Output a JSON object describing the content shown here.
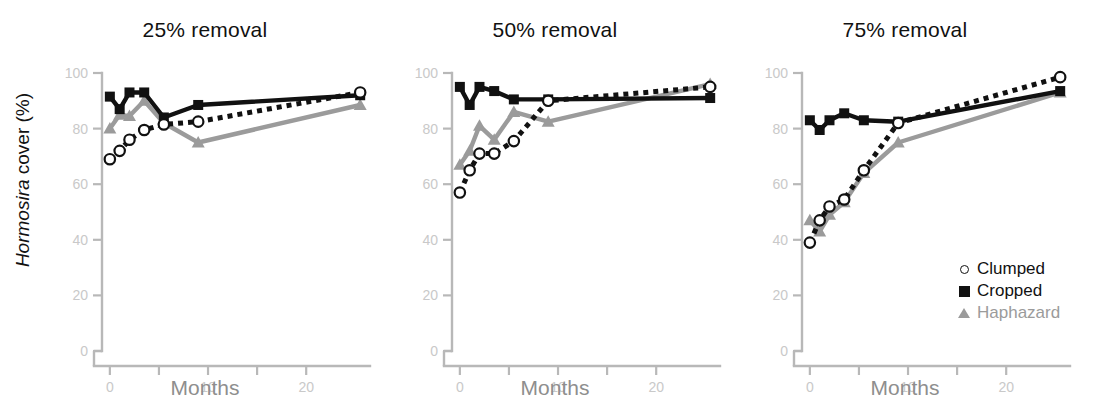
{
  "figure": {
    "ylabel_italic": "Hormosira",
    "ylabel_rest": " cover (%)",
    "ylabel_full": "Hormosira cover (%)"
  },
  "legend": {
    "position": "inside-bottom-right-panel3",
    "items": [
      {
        "label": "Clumped",
        "marker": "open-circle",
        "color": "#111111"
      },
      {
        "label": "Cropped",
        "marker": "filled-square",
        "color": "#111111"
      },
      {
        "label": "Haphazard",
        "marker": "filled-triangle",
        "color": "#9b9b9b"
      }
    ]
  },
  "colors": {
    "clumped": "#111111",
    "cropped": "#111111",
    "haphazard": "#9b9b9b",
    "axis": "#b8b8b8",
    "tick_text": "#c9c9c9",
    "xlabel": "#8e8e8e",
    "title": "#111111"
  },
  "chart_data": [
    {
      "type": "line",
      "title": "25% removal",
      "xlabel": "Months",
      "ylabel": "Hormosira cover (%)",
      "xlim": [
        -0.8,
        26.5
      ],
      "ylim": [
        0,
        100
      ],
      "xticks": [
        0,
        10,
        20
      ],
      "xminorticks": [
        5,
        15
      ],
      "yticks": [
        0,
        20,
        40,
        60,
        80,
        100
      ],
      "grid": false,
      "series": [
        {
          "name": "Clumped",
          "marker": "open-circle",
          "linestyle": "dotted",
          "color": "#111111",
          "x": [
            0,
            1,
            2,
            3.5,
            5.5,
            9,
            25.5
          ],
          "y": [
            69,
            72,
            76,
            79.5,
            81.5,
            82.5,
            93
          ]
        },
        {
          "name": "Cropped",
          "marker": "filled-square",
          "linestyle": "solid",
          "color": "#111111",
          "x": [
            0,
            1,
            2,
            3.5,
            5.5,
            9,
            25.5
          ],
          "y": [
            91.5,
            87,
            93,
            93,
            84,
            88.5,
            92
          ]
        },
        {
          "name": "Haphazard",
          "marker": "filled-triangle",
          "linestyle": "solid",
          "color": "#9b9b9b",
          "x": [
            0,
            1,
            2,
            3.5,
            5.5,
            9,
            25.5
          ],
          "y": [
            80,
            85,
            84.5,
            90,
            82,
            75,
            88.5
          ]
        }
      ]
    },
    {
      "type": "line",
      "title": "50% removal",
      "xlabel": "Months",
      "ylabel": "Hormosira cover (%)",
      "xlim": [
        -0.8,
        26.5
      ],
      "ylim": [
        0,
        100
      ],
      "xticks": [
        0,
        10,
        20
      ],
      "xminorticks": [
        5,
        15
      ],
      "yticks": [
        0,
        20,
        40,
        60,
        80,
        100
      ],
      "grid": false,
      "series": [
        {
          "name": "Clumped",
          "marker": "open-circle",
          "linestyle": "dotted",
          "color": "#111111",
          "x": [
            0,
            1,
            2,
            3.5,
            5.5,
            9,
            25.5
          ],
          "y": [
            57,
            65,
            71,
            71,
            75.5,
            90,
            95
          ]
        },
        {
          "name": "Cropped",
          "marker": "filled-square",
          "linestyle": "solid",
          "color": "#111111",
          "x": [
            0,
            1,
            2,
            3.5,
            5.5,
            9,
            25.5
          ],
          "y": [
            95,
            88.5,
            95,
            93.5,
            90.5,
            90.5,
            91
          ]
        },
        {
          "name": "Haphazard",
          "marker": "filled-triangle",
          "linestyle": "solid",
          "color": "#9b9b9b",
          "x": [
            0,
            1,
            2,
            3.5,
            5.5,
            9,
            25.5
          ],
          "y": [
            67,
            72,
            81,
            76,
            86,
            82.5,
            96
          ]
        }
      ]
    },
    {
      "type": "line",
      "title": "75% removal",
      "xlabel": "Months",
      "ylabel": "Hormosira cover (%)",
      "xlim": [
        -0.8,
        26.5
      ],
      "ylim": [
        0,
        100
      ],
      "xticks": [
        0,
        10,
        20
      ],
      "xminorticks": [
        5,
        15
      ],
      "yticks": [
        0,
        20,
        40,
        60,
        80,
        100
      ],
      "grid": false,
      "series": [
        {
          "name": "Clumped",
          "marker": "open-circle",
          "linestyle": "dotted",
          "color": "#111111",
          "x": [
            0,
            1,
            2,
            3.5,
            5.5,
            9,
            25.5
          ],
          "y": [
            39,
            47,
            52,
            54.5,
            65,
            82,
            98.5
          ]
        },
        {
          "name": "Cropped",
          "marker": "filled-square",
          "linestyle": "solid",
          "color": "#111111",
          "x": [
            0,
            1,
            2,
            3.5,
            5.5,
            9,
            25.5
          ],
          "y": [
            83,
            79.5,
            83,
            85.5,
            83,
            82.5,
            93.5
          ]
        },
        {
          "name": "Haphazard",
          "marker": "filled-triangle",
          "linestyle": "solid",
          "color": "#9b9b9b",
          "x": [
            0,
            1,
            2,
            3.5,
            5.5,
            9,
            25.5
          ],
          "y": [
            47,
            43,
            49,
            53.5,
            64,
            75,
            93
          ]
        }
      ]
    }
  ]
}
